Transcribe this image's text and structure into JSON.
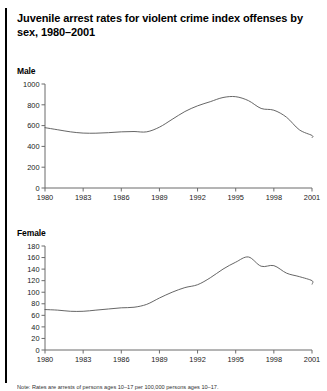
{
  "figure": {
    "title": "Juvenile arrest rates for violent crime index offenses by sex, 1980–2001",
    "left_rule": "page-left-rule"
  },
  "footnote": {
    "text": "Note: Rates are arrests of persons ages 10–17 per 100,000 persons ages 10–17."
  },
  "chart_data": [
    {
      "type": "line",
      "panel_label": "Male",
      "title": "Juvenile arrest rates for violent crime index offenses by sex, 1980–2001",
      "xlabel": "",
      "ylabel": "",
      "grid": false,
      "legend": "none",
      "xlim": [
        1980,
        2001
      ],
      "ylim": [
        0,
        1000
      ],
      "yticks": [
        0,
        200,
        400,
        600,
        800,
        1000
      ],
      "ytick_labels": [
        "0",
        "200",
        "400",
        "600",
        "800",
        "1000"
      ],
      "xticks": [
        1980,
        1983,
        1986,
        1989,
        1992,
        1995,
        1998,
        2001
      ],
      "xtick_labels": [
        "1980",
        "1983",
        "1986",
        "1989",
        "1992",
        "1995",
        "1998",
        "2001"
      ],
      "x": [
        1980,
        1981,
        1982,
        1983,
        1984,
        1985,
        1986,
        1987,
        1988,
        1989,
        1990,
        1991,
        1992,
        1993,
        1994,
        1995,
        1996,
        1997,
        1998,
        1999,
        2000,
        2001
      ],
      "series": [
        {
          "name": "Male",
          "color": "#555555",
          "values": [
            580,
            560,
            540,
            528,
            527,
            532,
            540,
            543,
            540,
            585,
            660,
            735,
            790,
            830,
            870,
            878,
            840,
            765,
            748,
            680,
            560,
            505,
            485
          ]
        }
      ]
    },
    {
      "type": "line",
      "panel_label": "Female",
      "title": "",
      "xlabel": "",
      "ylabel": "",
      "grid": false,
      "legend": "none",
      "xlim": [
        1980,
        2001
      ],
      "ylim": [
        0,
        180
      ],
      "yticks": [
        0,
        20,
        40,
        60,
        80,
        100,
        120,
        140,
        160,
        180
      ],
      "ytick_labels": [
        "0",
        "20",
        "40",
        "60",
        "80",
        "100",
        "120",
        "140",
        "160",
        "180"
      ],
      "xticks": [
        1980,
        1983,
        1986,
        1989,
        1992,
        1995,
        1998,
        2001
      ],
      "xtick_labels": [
        "1980",
        "1983",
        "1986",
        "1989",
        "1992",
        "1995",
        "1998",
        "2001"
      ],
      "x": [
        1980,
        1981,
        1982,
        1983,
        1984,
        1985,
        1986,
        1987,
        1988,
        1989,
        1990,
        1991,
        1992,
        1993,
        1994,
        1995,
        1996,
        1997,
        1998,
        1999,
        2000,
        2001
      ],
      "series": [
        {
          "name": "Female",
          "color": "#555555",
          "values": [
            70,
            69,
            67,
            67,
            69,
            71,
            73,
            74,
            79,
            90,
            100,
            108,
            113,
            125,
            140,
            152,
            161,
            145,
            146,
            133,
            127,
            120,
            114
          ]
        }
      ]
    }
  ]
}
